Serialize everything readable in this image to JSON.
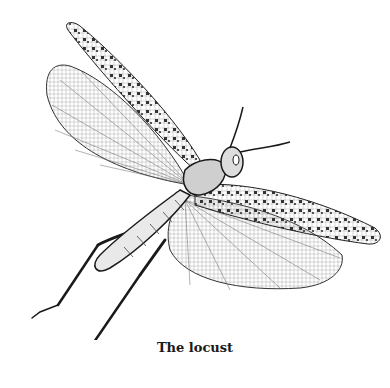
{
  "figure": {
    "subject": "locust",
    "style": "black-and-white line engraving",
    "caption": "The locust"
  },
  "colors": {
    "ink": "#1a1a1a",
    "paper": "#ffffff"
  }
}
